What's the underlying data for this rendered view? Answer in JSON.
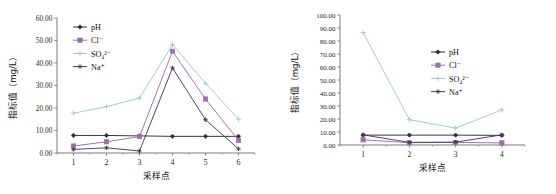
{
  "figure": {
    "panel_count": 2
  },
  "chart_data": [
    {
      "type": "line",
      "panel": "left",
      "title": "",
      "xlabel": "采样点",
      "ylabel": "指标值（mg/L）",
      "categories": [
        "1",
        "2",
        "3",
        "4",
        "5",
        "6"
      ],
      "xtick_labels": [
        "1",
        "2",
        "3",
        "4",
        "5",
        "6"
      ],
      "ytick_labels": [
        "0.00",
        "10.00",
        "20.00",
        "30.00",
        "40.00",
        "50.00",
        "60.00"
      ],
      "ylim": [
        0,
        60
      ],
      "ytick_step": 10,
      "grid": false,
      "legend_position": "top-left-inside",
      "series": [
        {
          "name": "pH",
          "marker": "diamond",
          "color": "#2c2c3a",
          "values": [
            7.8,
            7.8,
            7.6,
            7.4,
            7.4,
            7.4
          ]
        },
        {
          "name": "Cl⁻",
          "marker": "square",
          "color": "#9b6fa8",
          "values": [
            3.1,
            5.0,
            7.3,
            45.2,
            24.0,
            5.6
          ]
        },
        {
          "name": "SO₄²⁻",
          "marker": "cross",
          "color": "#9ec9c9",
          "values": [
            17.7,
            20.6,
            24.4,
            48.2,
            31.0,
            15.0
          ]
        },
        {
          "name": "Na⁺",
          "marker": "star",
          "color": "#4a3a5a",
          "values": [
            1.6,
            2.3,
            0.9,
            37.8,
            14.8,
            1.8
          ]
        }
      ]
    },
    {
      "type": "line",
      "panel": "right",
      "title": "",
      "xlabel": "采样点",
      "ylabel": "指标值（mg/L）",
      "categories": [
        "1",
        "2",
        "3",
        "4"
      ],
      "xtick_labels": [
        "1",
        "2",
        "3",
        "4"
      ],
      "ytick_labels": [
        "0.00",
        "10.00",
        "20.00",
        "30.00",
        "40.00",
        "50.00",
        "60.00",
        "70.00",
        "80.00",
        "90.00",
        "100.00"
      ],
      "ylim": [
        0,
        100
      ],
      "ytick_step": 10,
      "grid": false,
      "legend_position": "top-center-inside",
      "series": [
        {
          "name": "pH",
          "marker": "diamond",
          "color": "#2c2c3a",
          "values": [
            7.6,
            7.6,
            7.6,
            7.4
          ]
        },
        {
          "name": "Cl⁻",
          "marker": "square",
          "color": "#9b6fa8",
          "values": [
            4.0,
            1.8,
            2.0,
            1.6
          ]
        },
        {
          "name": "SO₄²⁻",
          "marker": "cross",
          "color": "#9ec9c9",
          "values": [
            86.5,
            19.5,
            13.0,
            27.0
          ]
        },
        {
          "name": "Na⁺",
          "marker": "star",
          "color": "#4a3a5a",
          "values": [
            7.8,
            2.0,
            2.2,
            7.8
          ]
        }
      ]
    }
  ]
}
